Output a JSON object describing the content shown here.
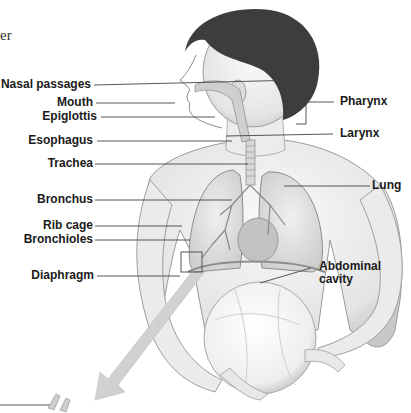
{
  "figure": {
    "title_fragment": "er",
    "labels_left": [
      {
        "id": "nasal-passages",
        "text": "Nasal passages"
      },
      {
        "id": "mouth",
        "text": "Mouth"
      },
      {
        "id": "epiglottis",
        "text": "Epiglottis"
      },
      {
        "id": "esophagus",
        "text": "Esophagus"
      },
      {
        "id": "trachea",
        "text": "Trachea"
      },
      {
        "id": "bronchus",
        "text": "Bronchus"
      },
      {
        "id": "rib-cage",
        "text": "Rib cage"
      },
      {
        "id": "bronchioles",
        "text": "Bronchioles"
      },
      {
        "id": "diaphragm",
        "text": "Diaphragm"
      }
    ],
    "labels_right": [
      {
        "id": "pharynx",
        "text": "Pharynx"
      },
      {
        "id": "larynx",
        "text": "Larynx"
      },
      {
        "id": "lung",
        "text": "Lung"
      },
      {
        "id": "abdominal-cavity",
        "text": "Abdominal cavity",
        "line1": "Abdominal",
        "line2": "cavity"
      }
    ],
    "colors": {
      "label_text": "#1a1a1a",
      "leader_line": "#444444",
      "skin_light": "#f2f2f2",
      "shading": "#bdbdbd",
      "hair": "#3a3a3a"
    }
  }
}
